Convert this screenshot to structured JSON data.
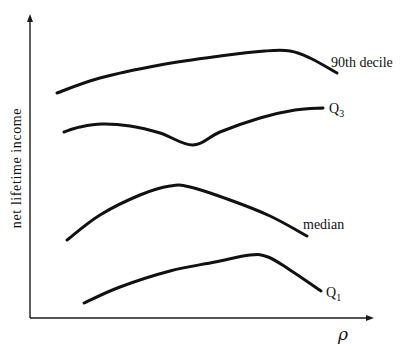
{
  "chart_data": {
    "type": "line",
    "title": "",
    "xlabel": "ρ",
    "ylabel": "net lifetime income",
    "grid": false,
    "ticks": false,
    "legend": "inline labels at curve ends",
    "series": [
      {
        "name": "90th decile",
        "label": "90th decile",
        "points": [
          [
            57,
            93
          ],
          [
            100,
            78
          ],
          [
            160,
            65
          ],
          [
            220,
            56
          ],
          [
            265,
            51
          ],
          [
            290,
            51
          ],
          [
            310,
            58
          ],
          [
            337,
            73
          ]
        ]
      },
      {
        "name": "Q3",
        "label": "Q",
        "subscript": "3",
        "points": [
          [
            64,
            132
          ],
          [
            80,
            127
          ],
          [
            102,
            124
          ],
          [
            130,
            126
          ],
          [
            160,
            133
          ],
          [
            193,
            145
          ],
          [
            220,
            132
          ],
          [
            260,
            118
          ],
          [
            295,
            110
          ],
          [
            323,
            108
          ]
        ]
      },
      {
        "name": "median",
        "label": "median",
        "points": [
          [
            67,
            240
          ],
          [
            100,
            215
          ],
          [
            140,
            195
          ],
          [
            170,
            186
          ],
          [
            190,
            187
          ],
          [
            230,
            200
          ],
          [
            270,
            216
          ],
          [
            307,
            236
          ]
        ]
      },
      {
        "name": "Q1",
        "label": "Q",
        "subscript": "1",
        "points": [
          [
            84,
            303
          ],
          [
            120,
            287
          ],
          [
            170,
            271
          ],
          [
            215,
            262
          ],
          [
            250,
            255
          ],
          [
            268,
            257
          ],
          [
            290,
            270
          ],
          [
            321,
            291
          ]
        ]
      }
    ]
  },
  "axes": {
    "y_label": "net lifetime income",
    "x_label": "ρ"
  }
}
